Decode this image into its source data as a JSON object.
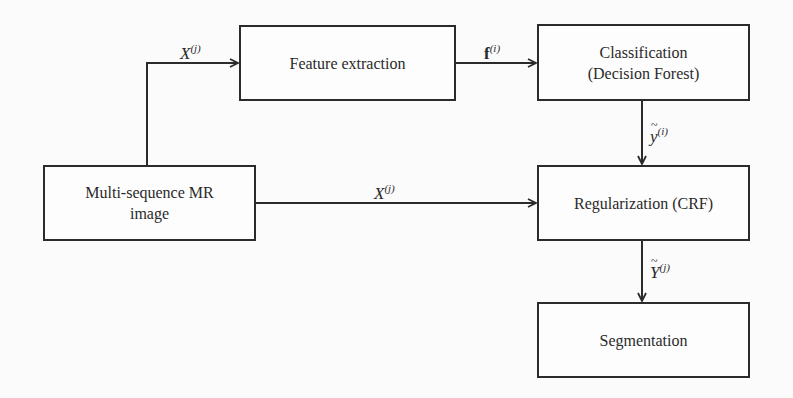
{
  "diagram": {
    "type": "flowchart",
    "nodes": {
      "input": {
        "lines": [
          "Multi-sequence MR",
          "image"
        ]
      },
      "feature": {
        "lines": [
          "Feature extraction"
        ]
      },
      "classification": {
        "lines": [
          "Classification",
          "(Decision Forest)"
        ]
      },
      "regularization": {
        "lines": [
          "Regularization (CRF)"
        ]
      },
      "segmentation": {
        "lines": [
          "Segmentation"
        ]
      }
    },
    "edges": {
      "input_to_feature": {
        "base": "X",
        "sup": "(j)",
        "from": "Multi-sequence MR image",
        "to": "Feature extraction"
      },
      "feature_to_classification": {
        "base": "f",
        "sup": "(i)",
        "from": "Feature extraction",
        "to": "Classification (Decision Forest)"
      },
      "classification_to_regularization": {
        "base": "y",
        "sup": "(i)",
        "accent": "tilde",
        "from": "Classification (Decision Forest)",
        "to": "Regularization (CRF)"
      },
      "input_to_regularization": {
        "base": "X",
        "sup": "(j)",
        "from": "Multi-sequence MR image",
        "to": "Regularization (CRF)"
      },
      "regularization_to_segmentation": {
        "base": "Y",
        "sup": "(j)",
        "accent": "tilde",
        "from": "Regularization (CRF)",
        "to": "Segmentation"
      }
    },
    "colors": {
      "stroke": "#2b2b2b",
      "background": "#fbfbfb"
    }
  }
}
